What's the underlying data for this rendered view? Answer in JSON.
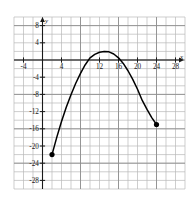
{
  "chart_data": {
    "type": "line",
    "title": "",
    "subtitle": "",
    "xlabel": "x",
    "ylabel": "y",
    "grid": true,
    "grid_step": 2,
    "legend": "none",
    "xlim": [
      -6,
      30
    ],
    "ylim": [
      -30,
      10
    ],
    "xticks": [
      -4,
      4,
      12,
      16,
      20,
      24,
      28
    ],
    "xtick_labels": [
      "-4",
      "4",
      "12",
      "16",
      "20",
      "24",
      "28"
    ],
    "yticks": [
      8,
      4,
      -4,
      -8,
      -12,
      -16,
      -20,
      -24,
      -28
    ],
    "ytick_labels": [
      "8",
      "4",
      "-4",
      "-8",
      "-12",
      "-16",
      "-20",
      "-24",
      "-28"
    ],
    "curve_description": "downward-opening parabola segment with filled endpoints",
    "vertex": [
      13,
      2
    ],
    "x_intercepts": [
      7,
      19.5
    ],
    "endpoints": [
      {
        "x": 2,
        "y": -22,
        "marker": "filled-circle"
      },
      {
        "x": 24,
        "y": -15,
        "marker": "filled-circle"
      }
    ],
    "series": [
      {
        "name": "parabola",
        "points": [
          [
            2,
            -22
          ],
          [
            3,
            -18
          ],
          [
            4,
            -14.3
          ],
          [
            5,
            -11
          ],
          [
            6,
            -8.1
          ],
          [
            7,
            -5.4
          ],
          [
            8,
            -3.1
          ],
          [
            9,
            -1.1
          ],
          [
            10,
            0.5
          ],
          [
            11,
            1.3
          ],
          [
            12,
            1.8
          ],
          [
            13,
            2
          ],
          [
            14,
            1.9
          ],
          [
            15,
            1.4
          ],
          [
            16,
            0.5
          ],
          [
            17,
            -0.8
          ],
          [
            18,
            -2.5
          ],
          [
            19,
            -4.5
          ],
          [
            20,
            -6.8
          ],
          [
            21,
            -9.4
          ],
          [
            22,
            -11.5
          ],
          [
            23,
            -13.4
          ],
          [
            24,
            -15
          ]
        ]
      }
    ]
  },
  "axes": {
    "x_axis_name": "x",
    "y_axis_name": "y"
  },
  "colors": {
    "curve": "#000000",
    "grid_minor": "#b9b9b9",
    "grid_major": "#8e8e8e",
    "axis": "#1a1a1a",
    "background": "#ffffff",
    "marker": "#000000"
  }
}
